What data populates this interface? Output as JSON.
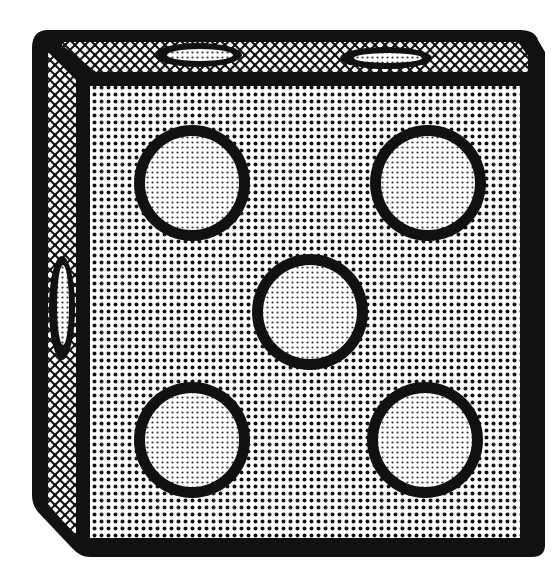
{
  "image": {
    "subject": "die",
    "face_value": 5,
    "colors": {
      "background": "#ffffff",
      "outline": "#111111",
      "dot_pattern": "#111111",
      "pip_fill": "#dcdcdc"
    },
    "front_face_pips": [
      {
        "cx": 192,
        "cy": 183,
        "r": 52
      },
      {
        "cx": 428,
        "cy": 183,
        "r": 52
      },
      {
        "cx": 310,
        "cy": 312,
        "r": 52
      },
      {
        "cx": 192,
        "cy": 440,
        "r": 52
      },
      {
        "cx": 425,
        "cy": 440,
        "r": 52
      }
    ],
    "top_face_pips": [
      {
        "cx": 200,
        "cy": 55,
        "rx": 40,
        "ry": 10
      },
      {
        "cx": 388,
        "cy": 58,
        "rx": 42,
        "ry": 9
      }
    ],
    "side_face_pips": [
      {
        "cx": 62,
        "cy": 308,
        "rx": 10,
        "ry": 48
      }
    ]
  }
}
